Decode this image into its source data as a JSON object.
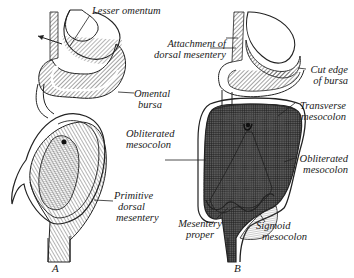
{
  "figure": {
    "panels": [
      {
        "id": "A",
        "letter": "A",
        "labels": [
          {
            "name": "lesser-omentum",
            "lines": [
              "Lesser omentum"
            ]
          },
          {
            "name": "omental-bursa",
            "lines": [
              "Omental",
              "bursa"
            ]
          },
          {
            "name": "primitive-dorsal-mesentery",
            "lines": [
              "Primitive",
              "dorsal",
              "mesentery"
            ]
          }
        ]
      },
      {
        "id": "B",
        "letter": "B",
        "labels": [
          {
            "name": "attachment-of-dorsal-mesentery",
            "lines": [
              "Attachment of",
              "dorsal mesentery"
            ]
          },
          {
            "name": "cut-edge-of-bursa",
            "lines": [
              "Cut edge",
              "of bursa"
            ]
          },
          {
            "name": "transverse-mesocolon",
            "lines": [
              "Transverse",
              "mesocolon"
            ]
          },
          {
            "name": "obliterated-mesocolon-left",
            "lines": [
              "Obliterated",
              "mesocolon"
            ]
          },
          {
            "name": "obliterated-mesocolon-right",
            "lines": [
              "Obliterated",
              "mesocolon"
            ]
          },
          {
            "name": "mesentery-proper",
            "lines": [
              "Mesentery",
              "proper"
            ]
          },
          {
            "name": "sigmoid-mesocolon",
            "lines": [
              "Sigmoid",
              "mesocolon"
            ]
          }
        ]
      }
    ]
  }
}
